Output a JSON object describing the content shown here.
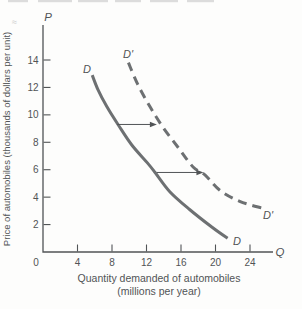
{
  "figure": {
    "background": "#fdfdfc",
    "ink_color": "#515456",
    "curve_color": "#6d7072",
    "remnant_color": "#dcdcdc"
  },
  "axes": {
    "p_label": "P",
    "q_label": "Q",
    "y_title": "Price of automobiles (thousands of dollars per unit)",
    "x_title_line1": "Quantity demanded of automobiles",
    "x_title_line2": "(millions per year)"
  },
  "chart_data": {
    "type": "line",
    "title": "",
    "xlabel": "Quantity demanded of automobiles (millions per year)",
    "ylabel": "Price of automobiles (thousands of dollars per unit)",
    "xlim": [
      0,
      26.5
    ],
    "ylim": [
      0,
      16.55
    ],
    "x_ticks": [
      0,
      4,
      8,
      12,
      16,
      20,
      24
    ],
    "y_ticks": [
      2,
      4,
      6,
      8,
      10,
      12,
      14
    ],
    "grid": false,
    "legend_position": "none",
    "series": [
      {
        "name": "D",
        "style": "solid",
        "points": [
          [
            5.7,
            12.9
          ],
          [
            6.4,
            11.8
          ],
          [
            7.4,
            10.6
          ],
          [
            8.7,
            9.3
          ],
          [
            10.3,
            7.8
          ],
          [
            12.1,
            6.5
          ],
          [
            13.0,
            5.8
          ],
          [
            14.7,
            4.4
          ],
          [
            17.0,
            3.1
          ],
          [
            19.6,
            1.8
          ],
          [
            21.4,
            1.0
          ]
        ]
      },
      {
        "name": "D'",
        "style": "dashed",
        "points": [
          [
            9.9,
            13.8
          ],
          [
            11.0,
            12.2
          ],
          [
            12.4,
            10.6
          ],
          [
            13.9,
            9.1
          ],
          [
            15.7,
            7.6
          ],
          [
            17.4,
            6.2
          ],
          [
            18.8,
            5.6
          ],
          [
            20.5,
            4.5
          ],
          [
            22.8,
            3.7
          ],
          [
            25.4,
            3.2
          ]
        ]
      }
    ],
    "shift_arrows": [
      {
        "p": 9.3,
        "q_from": 8.6,
        "q_to": 13.2
      },
      {
        "p": 5.8,
        "q_from": 13.2,
        "q_to": 18.6
      }
    ],
    "curve_labels": [
      {
        "text": "D",
        "position": "top-of-solid-curve"
      },
      {
        "text": "D'",
        "position": "top-of-dashed-curve"
      },
      {
        "text": "D",
        "position": "bottom-of-solid-curve"
      },
      {
        "text": "D'",
        "position": "bottom-of-dashed-curve"
      }
    ]
  },
  "top_crop_marks": {
    "squiggle": "≈",
    "segments": [
      [
        8,
        20
      ],
      [
        38,
        34
      ],
      [
        78,
        30
      ],
      [
        115,
        26
      ],
      [
        150,
        28
      ],
      [
        187,
        27
      ]
    ]
  }
}
